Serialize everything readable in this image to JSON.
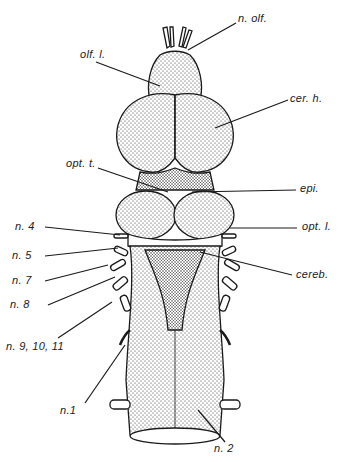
{
  "figure": {
    "colors": {
      "ink": "#1a1a1a",
      "background": "#ffffff",
      "stipple": "#2a2a2a"
    }
  },
  "labels": {
    "n_olf": "n. olf.",
    "olf_l": "olf. l.",
    "cer_h": "cer. h.",
    "opt_t": "opt. t.",
    "epi": "epi.",
    "n_4": "n. 4",
    "opt_l": "opt. l.",
    "n_5": "n. 5",
    "n_7": "n. 7",
    "cereb": "cereb.",
    "n_8": "n. 8",
    "n_9_10_11": "n. 9, 10, 11",
    "n_1": "n.1",
    "n_2": "n. 2"
  }
}
